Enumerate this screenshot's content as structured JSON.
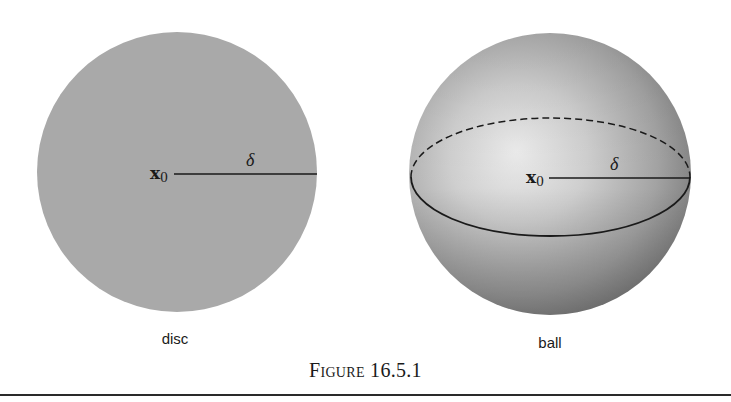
{
  "figure": {
    "caption_word": "Figure",
    "caption_number": "16.5.1",
    "panels": [
      {
        "id": "disc",
        "label": "disc",
        "center_label": "x",
        "center_subscript": "0",
        "radius_label": "δ",
        "fill_color": "#a9a9a9"
      },
      {
        "id": "ball",
        "label": "ball",
        "center_label": "x",
        "center_subscript": "0",
        "radius_label": "δ",
        "highlight_color": "#e6e6e6",
        "shadow_color": "#6e6e6e"
      }
    ]
  },
  "colors": {
    "background": "#ffffff",
    "line": "#1a1a1a",
    "rule": "#2a2a2a"
  }
}
